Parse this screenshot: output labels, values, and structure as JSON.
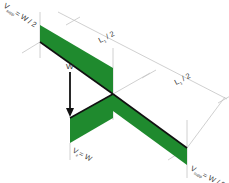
{
  "diagram": {
    "type": "shear-force-diagram",
    "colors": {
      "fill": "#1f8a2e",
      "edge": "#111111",
      "guide": "#bdbdbd",
      "text": "#333333"
    },
    "labels": {
      "support_left": {
        "main": "V",
        "sub": "supp",
        "rest": "= W / 2"
      },
      "support_right": {
        "main": "V",
        "sub": "supp",
        "rest": "= W / 2"
      },
      "center_shear": {
        "main": "V",
        "sub": "z",
        "rest": "= W"
      },
      "load": "W",
      "dim_left": {
        "main": "L",
        "sub": "1",
        "rest": " / 2"
      },
      "dim_right": {
        "main": "L",
        "sub": "1",
        "rest": " / 2"
      }
    }
  }
}
